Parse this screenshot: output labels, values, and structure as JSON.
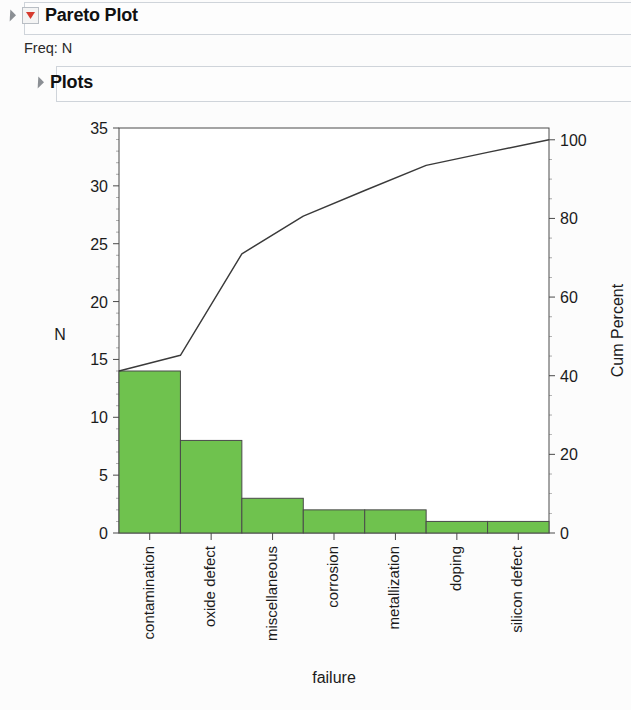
{
  "report": {
    "title": "Pareto Plot",
    "freq_label": "Freq: N",
    "section_title": "Plots",
    "disclosure_icon": "disclosure-triangle-icon",
    "report_icon": "jmp-red-report-icon"
  },
  "colors": {
    "bar_fill": "#6fc24e",
    "bar_stroke": "#4a4a4a",
    "line": "#3a3a3a",
    "axis": "#4a4a4a",
    "panel_border": "#cfd4da",
    "text": "#1b1b1b"
  },
  "chart_data": {
    "type": "bar",
    "title": "Pareto Plot",
    "categories": [
      "contamination",
      "oxide defect",
      "miscellaneous",
      "corrosion",
      "metallization",
      "doping",
      "silicon defect"
    ],
    "values": [
      14,
      8,
      3,
      2,
      2,
      1,
      1
    ],
    "series": [
      {
        "name": "N",
        "type": "bar",
        "values": [
          14,
          8,
          3,
          2,
          2,
          1,
          1
        ]
      },
      {
        "name": "Cum Percent",
        "type": "line",
        "values": [
          45.2,
          71.0,
          80.6,
          87.1,
          93.5,
          96.8,
          100.0
        ]
      }
    ],
    "total": 31,
    "xlabel": "failure",
    "ylabel": "N",
    "y2label": "Cum Percent",
    "ylim": [
      0,
      35
    ],
    "y2lim": [
      0,
      103
    ],
    "yticks": [
      0,
      5,
      10,
      15,
      20,
      25,
      30,
      35
    ],
    "y2ticks": [
      0,
      20,
      40,
      60,
      80,
      100
    ],
    "grid": false,
    "legend": "none"
  }
}
